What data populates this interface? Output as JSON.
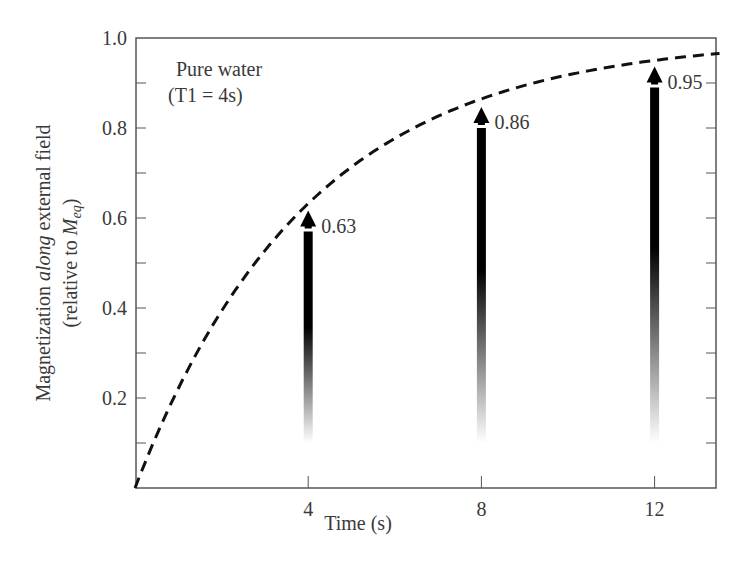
{
  "chart_data": {
    "type": "line",
    "title": "",
    "xlabel": "Time (s)",
    "ylabel_line1_prefix": "Magnetization ",
    "ylabel_line1_italic": "along",
    "ylabel_line1_suffix": " external field",
    "ylabel_line2_prefix": "(relative to ",
    "ylabel_line2_symbol": "M",
    "ylabel_line2_subscript": "eq",
    "ylabel_line2_suffix": ")",
    "xlim": [
      0,
      13.5
    ],
    "ylim": [
      0,
      1.0
    ],
    "x_ticks": [
      4,
      8,
      12
    ],
    "x_tick_labels": [
      "4",
      "8",
      "12"
    ],
    "y_ticks": [
      0.2,
      0.4,
      0.6,
      0.8,
      1.0
    ],
    "y_tick_labels": [
      "0.2",
      "0.4",
      "0.6",
      "0.8",
      "1.0"
    ],
    "y_minor_ticks": [
      0.1,
      0.3,
      0.5,
      0.7,
      0.9
    ],
    "grid": false,
    "annotation": {
      "line1": "Pure water",
      "line2": "(T1 = 4s)"
    },
    "series": [
      {
        "name": "M(t) = 1 - exp(-t/T1)",
        "style": "dashed",
        "T1": 4,
        "x": [
          0,
          1,
          2,
          3,
          4,
          5,
          6,
          7,
          8,
          9,
          10,
          11,
          12,
          13,
          13.5
        ],
        "values": [
          0,
          0.22,
          0.39,
          0.53,
          0.63,
          0.71,
          0.78,
          0.83,
          0.86,
          0.89,
          0.92,
          0.94,
          0.95,
          0.96,
          0.97
        ]
      }
    ],
    "arrows": [
      {
        "x": 4,
        "value": 0.63,
        "label": "0.63"
      },
      {
        "x": 8,
        "value": 0.86,
        "label": "0.86"
      },
      {
        "x": 12,
        "value": 0.95,
        "label": "0.95"
      }
    ]
  }
}
